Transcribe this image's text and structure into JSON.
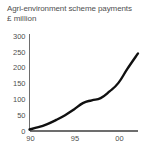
{
  "chart_data": {
    "type": "line",
    "title": "Agri-environment scheme payments",
    "subtitle": "£ million",
    "xlabel": "",
    "ylabel": "£ million",
    "ylim": [
      0,
      300
    ],
    "xlim": [
      1990,
      2002.2
    ],
    "grid": false,
    "legend": null,
    "ytick_labels": [
      "300",
      "250",
      "200",
      "150",
      "100",
      "50",
      "0"
    ],
    "ytick_values": [
      300,
      250,
      200,
      150,
      100,
      50,
      0
    ],
    "xtick_labels": [
      "90",
      "95",
      "00"
    ],
    "xtick_values": [
      1990,
      1995,
      2000
    ],
    "series": [
      {
        "name": "Agri-environment scheme payments",
        "x": [
          1990,
          1991,
          1992,
          1993,
          1994,
          1995,
          1996,
          1997,
          1998,
          1999,
          2000,
          2001,
          2002.2
        ],
        "values": [
          5,
          12,
          22,
          35,
          50,
          68,
          88,
          97,
          104,
          125,
          152,
          196,
          245
        ]
      }
    ]
  },
  "figure": {
    "title_line1": "Agri-environment scheme payments",
    "title_line2": "£ million"
  }
}
